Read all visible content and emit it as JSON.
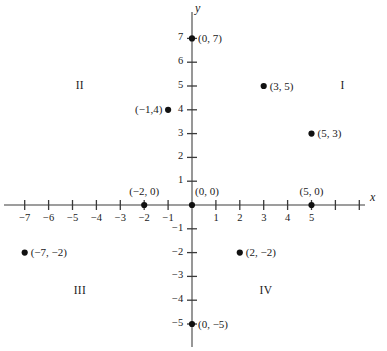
{
  "figure": {
    "kind": "cartesian-coordinate-plane",
    "axis_labels": {
      "x": "x",
      "y": "y"
    },
    "colors": {
      "axis": "#7d7d7d",
      "tick": "#3a3a3a",
      "point": "#111111",
      "text": "#1a1a1a",
      "background": "#ffffff"
    }
  },
  "chart_data": {
    "type": "scatter",
    "title": "",
    "xlabel": "x",
    "ylabel": "y",
    "xlim": [
      -7.8,
      7.8
    ],
    "ylim": [
      -5.9,
      7.8
    ],
    "grid": false,
    "legend": "none",
    "x_ticks": [
      -7,
      -6,
      -5,
      -4,
      -3,
      -2,
      -1,
      1,
      2,
      3,
      4,
      5,
      6,
      7
    ],
    "x_tick_labels": [
      "−7",
      "−6",
      "−5",
      "−4",
      "−3",
      "−2",
      "−1",
      "1",
      "2",
      "3",
      "4",
      "5",
      "",
      ""
    ],
    "y_ticks": [
      7,
      6,
      5,
      4,
      3,
      2,
      1,
      -1,
      -2,
      -3,
      -4,
      -5
    ],
    "y_tick_labels": [
      "7",
      "6",
      "5",
      "4",
      "3",
      "2",
      "1",
      "−1",
      "−2",
      "−3",
      "−4",
      "−5"
    ],
    "points": [
      {
        "x": 0,
        "y": 7,
        "label": "(0, 7)",
        "label_pos": "right"
      },
      {
        "x": 3,
        "y": 5,
        "label": "(3, 5)",
        "label_pos": "right"
      },
      {
        "x": -1,
        "y": 4,
        "label": "(−1,4)",
        "label_pos": "left"
      },
      {
        "x": 5,
        "y": 3,
        "label": "(5, 3)",
        "label_pos": "right"
      },
      {
        "x": -2,
        "y": 0,
        "label": "(−2, 0)",
        "label_pos": "above"
      },
      {
        "x": 0,
        "y": 0,
        "label": "(0, 0)",
        "label_pos": "above-right"
      },
      {
        "x": 5,
        "y": 0,
        "label": "(5, 0)",
        "label_pos": "above"
      },
      {
        "x": -7,
        "y": -2,
        "label": "(−7, −2)",
        "label_pos": "right"
      },
      {
        "x": 2,
        "y": -2,
        "label": "(2, −2)",
        "label_pos": "right"
      },
      {
        "x": 0,
        "y": -5,
        "label": "(0, −5)",
        "label_pos": "right"
      }
    ],
    "quadrant_labels": [
      {
        "name": "I",
        "x": 6.3,
        "y": 5.0
      },
      {
        "name": "II",
        "x": -4.7,
        "y": 5.0
      },
      {
        "name": "III",
        "x": -4.7,
        "y": -3.6
      },
      {
        "name": "IV",
        "x": 3.1,
        "y": -3.6
      }
    ]
  }
}
